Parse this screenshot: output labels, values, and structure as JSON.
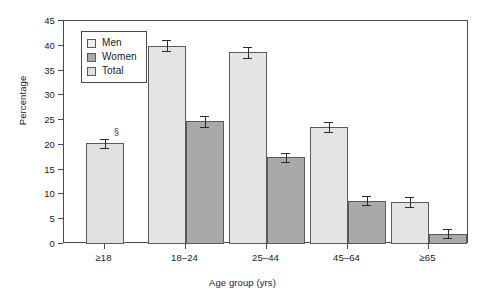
{
  "chart_data": {
    "type": "bar",
    "title": "",
    "xlabel": "Age group (yrs)",
    "ylabel": "Percentage",
    "ylim": [
      0,
      45
    ],
    "ytick_step": 5,
    "yticks": [
      0,
      5,
      10,
      15,
      20,
      25,
      30,
      35,
      40,
      45
    ],
    "grid": false,
    "legend_position": "top-left-inside",
    "categories": [
      "≥18",
      "18–24",
      "25–44",
      "45–64",
      "≥65"
    ],
    "series": [
      {
        "name": "Men",
        "color": "#e4e4e4",
        "values": [
          null,
          40.0,
          38.7,
          23.6,
          8.4
        ],
        "err_low": [
          null,
          38.9,
          37.5,
          22.6,
          7.4
        ],
        "err_high": [
          null,
          41.1,
          39.7,
          24.6,
          9.4
        ]
      },
      {
        "name": "Women",
        "color": "#a9a9a9",
        "values": [
          null,
          24.8,
          17.5,
          8.7,
          2.1
        ],
        "err_low": [
          null,
          23.7,
          16.6,
          7.9,
          1.3
        ],
        "err_high": [
          null,
          25.9,
          18.4,
          9.6,
          3.0
        ]
      },
      {
        "name": "Total",
        "color": "#e0e0e0",
        "values": [
          20.3,
          null,
          null,
          null,
          null
        ],
        "err_low": [
          19.4,
          null,
          null,
          null,
          null
        ],
        "err_high": [
          21.2,
          null,
          null,
          null,
          null
        ]
      }
    ],
    "annotations": [
      {
        "text": "§",
        "category": "≥18",
        "series": "Total"
      }
    ]
  },
  "legend": {
    "items": [
      {
        "label": "Men",
        "swatch": "men"
      },
      {
        "label": "Women",
        "swatch": "women"
      },
      {
        "label": "Total",
        "swatch": "total"
      }
    ]
  },
  "axes": {
    "y": {
      "label": "Percentage",
      "ticks": [
        "0",
        "5",
        "10",
        "15",
        "20",
        "25",
        "30",
        "35",
        "40",
        "45"
      ]
    },
    "x": {
      "label": "Age group (yrs)",
      "ticks": [
        "≥18",
        "18–24",
        "25–44",
        "45–64",
        "≥65"
      ]
    }
  }
}
